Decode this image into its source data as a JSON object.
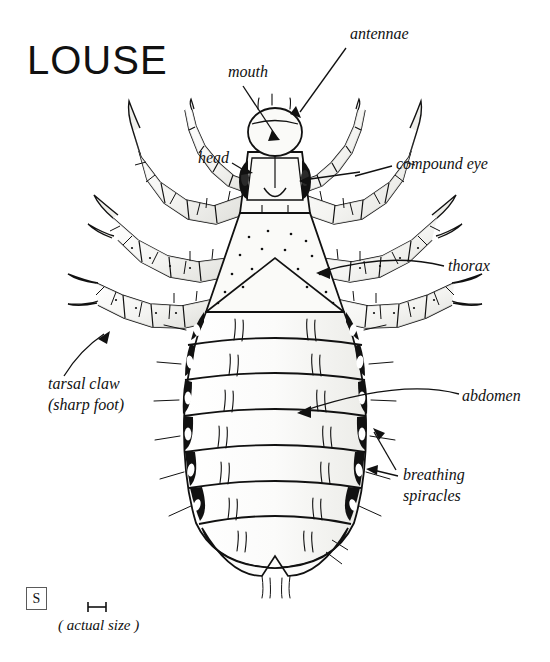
{
  "page": {
    "title": "LOUSE",
    "background_color": "#ffffff",
    "ink_color": "#111111",
    "body_fill": "#f7f7f5",
    "shade_fill": "#e3e3df"
  },
  "labels": {
    "antennae": "antennae",
    "mouth": "mouth",
    "head": "head",
    "compound_eye": "compound eye",
    "thorax": "thorax",
    "abdomen": "abdomen",
    "breathing_line1": "breathing",
    "breathing_line2": "spiracles",
    "tarsal_line1": "tarsal claw",
    "tarsal_line2": "(sharp foot)"
  },
  "scale": {
    "box_letter": "S",
    "caption": "( actual size )"
  },
  "diagram": {
    "segments": 7,
    "legs": 6,
    "antenna_segments": 5
  }
}
